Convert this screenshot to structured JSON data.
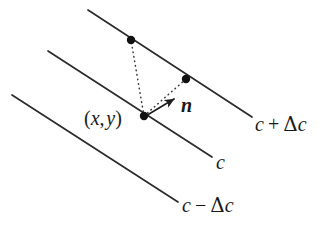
{
  "figure": {
    "background_color": "#ffffff",
    "stroke_color": "#2b2b2b",
    "dot_color": "#111111",
    "width": 331,
    "height": 226
  },
  "lines": [
    {
      "id": "line-upper",
      "label": "c + Δc",
      "label_parts": {
        "base": "c",
        "operator": "+",
        "delta": "Δ",
        "delta_base": "c"
      },
      "x1": 88,
      "y1": 10,
      "x2": 252,
      "y2": 117
    },
    {
      "id": "line-middle",
      "label": "c",
      "label_parts": {
        "base": "c",
        "operator": "",
        "delta": "",
        "delta_base": ""
      },
      "x1": 48,
      "y1": 51,
      "x2": 212,
      "y2": 157
    },
    {
      "id": "line-lower",
      "label": "c − Δc",
      "label_parts": {
        "base": "c",
        "operator": "−",
        "delta": "Δ",
        "delta_base": "c"
      },
      "x1": 12,
      "y1": 95,
      "x2": 178,
      "y2": 202
    }
  ],
  "points": [
    {
      "id": "point-upper-left",
      "x": 131,
      "y": 40,
      "label": ""
    },
    {
      "id": "point-upper-right",
      "x": 186,
      "y": 79,
      "label": ""
    },
    {
      "id": "point-center",
      "x": 144,
      "y": 116,
      "label": "(x, y)"
    }
  ],
  "dotted_connectors": [
    {
      "id": "connector-center-to-upper-left",
      "x1": 144,
      "y1": 116,
      "x2": 131,
      "y2": 40
    },
    {
      "id": "connector-center-to-upper-right",
      "x1": 144,
      "y1": 116,
      "x2": 186,
      "y2": 79
    }
  ],
  "vector": {
    "id": "normal-vector",
    "label": "n",
    "x1": 144,
    "y1": 117,
    "x2": 174,
    "y2": 99
  },
  "labels": {
    "point_label": "(x, y)",
    "point_label_parts": {
      "open": "(",
      "x": "x",
      "comma": ",",
      "y": "y",
      "close": ")"
    },
    "vector_label": "n",
    "upper_line_label": "c + Δc",
    "middle_line_label": "c",
    "lower_line_label": "c − Δc"
  }
}
